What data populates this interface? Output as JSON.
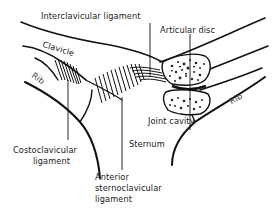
{
  "diagram": {
    "type": "anatomical-illustration",
    "labels": {
      "interclavicular_ligament": "Interclavicular ligament",
      "articular_disc": "Articular disc",
      "clavicle": "Clavicle",
      "rib_left": "Rib",
      "rib_right": "Rib",
      "joint_cavity": "Joint cavity",
      "costoclavicular_ligament_line1": "Costoclavicular",
      "costoclavicular_ligament_line2": "ligament",
      "sternum": "Sternum",
      "anterior_sc_line1": "Anterior",
      "anterior_sc_line2": "sternoclavicular",
      "anterior_sc_line3": "ligament"
    },
    "colors": {
      "line": "#111111",
      "background": "#ffffff"
    }
  }
}
